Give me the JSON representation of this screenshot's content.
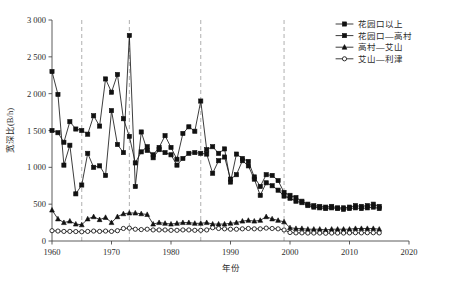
{
  "chart_data": {
    "type": "line",
    "title": "",
    "xlabel": "年份",
    "ylabel": "宽深比(B/h)",
    "xlim": [
      1960,
      2020
    ],
    "ylim": [
      0,
      3000
    ],
    "xticks": [
      1960,
      1970,
      1980,
      1990,
      2000,
      2010,
      2020
    ],
    "xtick_labels": [
      "1960",
      "1970",
      "1980",
      "1990",
      "2000",
      "2010",
      "2020"
    ],
    "yticks": [
      0,
      500,
      1000,
      1500,
      2000,
      2500,
      3000
    ],
    "ytick_labels": [
      "0",
      "500",
      "1 000",
      "1 500",
      "2 000",
      "2 500",
      "3 000"
    ],
    "grid": false,
    "legend_position": "top-right",
    "reference_lines": [
      1965,
      1973,
      1985,
      1999
    ],
    "x": [
      1960,
      1961,
      1962,
      1963,
      1964,
      1965,
      1966,
      1967,
      1968,
      1969,
      1970,
      1971,
      1972,
      1973,
      1974,
      1975,
      1976,
      1977,
      1978,
      1979,
      1980,
      1981,
      1982,
      1983,
      1984,
      1985,
      1986,
      1987,
      1988,
      1989,
      1990,
      1991,
      1992,
      1993,
      1994,
      1995,
      1996,
      1997,
      1998,
      1999,
      2000,
      2001,
      2002,
      2003,
      2004,
      2005,
      2006,
      2007,
      2008,
      2009,
      2010,
      2011,
      2012,
      2013,
      2014,
      2015
    ],
    "series": [
      {
        "name": "花园口以上",
        "marker": "filled-square",
        "values": [
          2300,
          1990,
          1030,
          1300,
          640,
          760,
          1190,
          1000,
          1020,
          890,
          1770,
          1310,
          1200,
          2790,
          740,
          1480,
          1230,
          1170,
          1270,
          1430,
          1270,
          1110,
          1460,
          1550,
          1490,
          1900,
          1240,
          1280,
          1190,
          1250,
          800,
          1180,
          1120,
          1080,
          870,
          740,
          900,
          890,
          820,
          660,
          620,
          590,
          540,
          500,
          480,
          470,
          460,
          470,
          450,
          450,
          460,
          480,
          470,
          480,
          500,
          470
        ]
      },
      {
        "name": "花园口—高村",
        "marker": "filled-square",
        "values": [
          1500,
          1470,
          1340,
          1620,
          1520,
          1500,
          1450,
          1700,
          1560,
          2200,
          2020,
          2260,
          1660,
          1420,
          1060,
          1210,
          1280,
          1130,
          1240,
          1200,
          1170,
          1030,
          1120,
          1190,
          1200,
          1190,
          1180,
          920,
          1090,
          1140,
          840,
          900,
          1090,
          1020,
          840,
          620,
          790,
          750,
          690,
          610,
          580,
          540,
          520,
          480,
          460,
          450,
          440,
          450,
          440,
          430,
          440,
          450,
          440,
          450,
          460,
          440
        ]
      },
      {
        "name": "高村—艾山",
        "marker": "filled-triangle",
        "values": [
          420,
          300,
          250,
          270,
          230,
          220,
          300,
          330,
          290,
          320,
          250,
          330,
          370,
          380,
          380,
          370,
          360,
          230,
          250,
          240,
          230,
          240,
          250,
          250,
          240,
          240,
          250,
          230,
          230,
          230,
          240,
          250,
          270,
          280,
          270,
          280,
          330,
          300,
          280,
          260,
          180,
          170,
          170,
          160,
          160,
          160,
          150,
          160,
          160,
          160,
          160,
          170,
          170,
          170,
          170,
          160
        ]
      },
      {
        "name": "艾山—利津",
        "marker": "open-circle",
        "values": [
          140,
          135,
          130,
          130,
          128,
          125,
          130,
          135,
          130,
          135,
          130,
          140,
          170,
          175,
          160,
          155,
          160,
          150,
          150,
          150,
          145,
          145,
          150,
          150,
          145,
          145,
          150,
          180,
          170,
          165,
          160,
          160,
          165,
          170,
          165,
          165,
          175,
          170,
          165,
          150,
          115,
          110,
          110,
          108,
          108,
          108,
          105,
          108,
          108,
          108,
          110,
          112,
          110,
          112,
          112,
          110
        ]
      }
    ]
  }
}
